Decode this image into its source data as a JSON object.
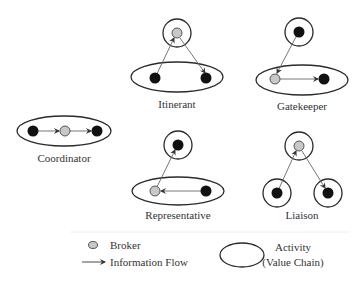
{
  "figure": {
    "roles": [
      {
        "id": "itinerant",
        "label": "Itinerant"
      },
      {
        "id": "gatekeeper",
        "label": "Gatekeeper"
      },
      {
        "id": "coordinator",
        "label": "Coordinator"
      },
      {
        "id": "representative",
        "label": "Representative"
      },
      {
        "id": "liaison",
        "label": "Liaison"
      }
    ]
  },
  "legend": {
    "broker_label": "Broker",
    "flow_label": "Information Flow",
    "activity_label_line1": "Activity",
    "activity_label_line2": "(Value Chain)"
  },
  "colors": {
    "actor": "#111111",
    "broker": "#c8c8c8",
    "outline": "#2a2a2a",
    "flow": "#666666"
  }
}
